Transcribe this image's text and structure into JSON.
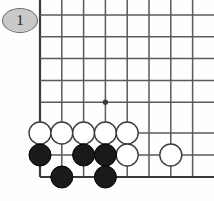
{
  "diagram": {
    "kind": "go-board-diagram",
    "label": "1",
    "label_shape": "ellipse",
    "label_fill": "#c9c9c9",
    "label_stroke": "#6e6e6e",
    "background": "#fefefe",
    "board": {
      "line_color": "#5a5a5a",
      "edge_color": "#3a3a3a",
      "cell": 21.8,
      "origin_x": 40,
      "origin_y": 15,
      "cols": 8,
      "rows": 8,
      "col_x": [
        40,
        61.8,
        83.6,
        105.4,
        127.2,
        149,
        170.8,
        192.6
      ],
      "row_y": [
        15,
        36.8,
        58.6,
        80.4,
        102.2,
        133,
        155,
        177
      ],
      "clipped": {
        "top": true,
        "right": true,
        "left_edge": true,
        "bottom_edge": true
      },
      "star_points": [
        {
          "col": 3,
          "row": 4
        }
      ]
    },
    "stones": {
      "white_color": "#ffffff",
      "white_stroke": "#3c3c3c",
      "black_color": "#1a1a1a",
      "black_stroke": "#000000",
      "radius": 11,
      "white": [
        {
          "col": 0,
          "row": 5
        },
        {
          "col": 1,
          "row": 5
        },
        {
          "col": 2,
          "row": 5
        },
        {
          "col": 3,
          "row": 5
        },
        {
          "col": 4,
          "row": 5
        },
        {
          "col": 4,
          "row": 6
        },
        {
          "col": 6,
          "row": 6
        }
      ],
      "black": [
        {
          "col": 0,
          "row": 6
        },
        {
          "col": 2,
          "row": 6
        },
        {
          "col": 3,
          "row": 6
        },
        {
          "col": 1,
          "row": 7
        },
        {
          "col": 3,
          "row": 7
        }
      ]
    }
  }
}
